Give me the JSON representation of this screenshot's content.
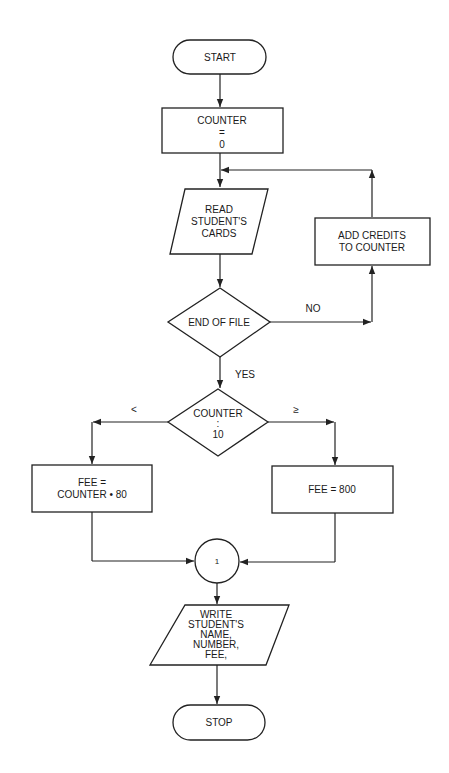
{
  "flowchart": {
    "start": {
      "label": "START"
    },
    "init": {
      "lines": [
        "COUNTER",
        "=",
        "0"
      ]
    },
    "read": {
      "lines": [
        "READ",
        "STUDENT'S",
        "CARDS"
      ]
    },
    "add_credits": {
      "lines": [
        "ADD CREDITS",
        "TO COUNTER"
      ]
    },
    "end_of_file": {
      "label": "END OF FILE",
      "no_label": "NO",
      "yes_label": "YES"
    },
    "compare": {
      "lines": [
        "COUNTER",
        ":",
        "10"
      ],
      "less_label": "<",
      "geq_label": "≥"
    },
    "fee_calc": {
      "lines": [
        "FEE =",
        "COUNTER • 80"
      ]
    },
    "fee_flat": {
      "label": "FEE = 800"
    },
    "connector": {
      "label": "1"
    },
    "write": {
      "lines": [
        "WRITE",
        "STUDENT'S",
        "NAME,",
        "NUMBER,",
        "FEE,"
      ]
    },
    "stop": {
      "label": "STOP"
    }
  },
  "colors": {
    "stroke": "#222222",
    "background": "#ffffff",
    "text": "#1a1a1a"
  }
}
